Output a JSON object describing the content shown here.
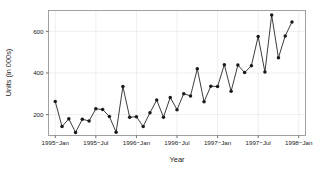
{
  "chart_data": {
    "type": "line",
    "title": "",
    "xlabel": "Year",
    "ylabel": "Units (in 000s)",
    "grid": true,
    "legend": "none",
    "marker": "filled-circle",
    "line_color": "#1a1a1a",
    "marker_color": "#1a1a1a",
    "grid_color": "#e8e8e8",
    "frame_color": "#7a7a7a",
    "background": "#ffffff",
    "xlim": [
      "1994-12",
      "1998-02"
    ],
    "ylim": [
      100,
      700
    ],
    "yticks": [
      200,
      400,
      600
    ],
    "ytick_labels": [
      "200",
      "400",
      "600"
    ],
    "xticks": [
      "1995-Jan",
      "1995-Jul",
      "1996-Jan",
      "1996-Jul",
      "1997-Jan",
      "1997-Jul",
      "1998-Jan"
    ],
    "xtick_labels": [
      "1995−Jan",
      "1995−Jul",
      "1996−Jan",
      "1996−Jul",
      "1997−Jan",
      "1997−Jul",
      "1998−Jan"
    ],
    "x": [
      "1995-Jan",
      "1995-Feb",
      "1995-Mar",
      "1995-Apr",
      "1995-May",
      "1995-Jun",
      "1995-Jul",
      "1995-Aug",
      "1995-Sep",
      "1995-Oct",
      "1995-Nov",
      "1995-Dec",
      "1996-Jan",
      "1996-Feb",
      "1996-Mar",
      "1996-Apr",
      "1996-May",
      "1996-Jun",
      "1996-Jul",
      "1996-Aug",
      "1996-Sep",
      "1996-Oct",
      "1996-Nov",
      "1996-Dec",
      "1997-Jan",
      "1997-Feb",
      "1997-Mar",
      "1997-Apr",
      "1997-May",
      "1997-Jun",
      "1997-Jul",
      "1997-Aug",
      "1997-Sep",
      "1997-Oct",
      "1997-Nov",
      "1997-Dec"
    ],
    "values": [
      263,
      143,
      180,
      115,
      178,
      170,
      228,
      225,
      191,
      116,
      335,
      188,
      190,
      143,
      209,
      270,
      188,
      283,
      224,
      301,
      290,
      420,
      262,
      337,
      335,
      440,
      312,
      438,
      402,
      435,
      575,
      405,
      678,
      473,
      578,
      645
    ],
    "series_name": "Units"
  }
}
